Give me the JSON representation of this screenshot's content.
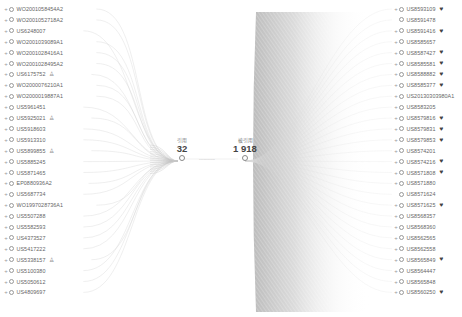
{
  "diagram": {
    "type": "citation-network",
    "left_group": {
      "caption": "引用",
      "count": "32"
    },
    "right_group": {
      "caption": "被引用",
      "count": "1 918"
    },
    "connector_label": "-----------",
    "left_nodes": [
      {
        "id": "WO2001058454A2",
        "badge": ""
      },
      {
        "id": "WO2001052718A2",
        "badge": ""
      },
      {
        "id": "US6248007",
        "badge": ""
      },
      {
        "id": "WO2001039089A1",
        "badge": ""
      },
      {
        "id": "WO2001028416A1",
        "badge": ""
      },
      {
        "id": "WO2001028495A2",
        "badge": ""
      },
      {
        "id": "US6175752",
        "badge": "person"
      },
      {
        "id": "WO2000076210A1",
        "badge": ""
      },
      {
        "id": "WO2000019887A1",
        "badge": ""
      },
      {
        "id": "US5961451",
        "badge": ""
      },
      {
        "id": "US5925021",
        "badge": "person"
      },
      {
        "id": "US5918603",
        "badge": ""
      },
      {
        "id": "US5913310",
        "badge": ""
      },
      {
        "id": "US5899855",
        "badge": "person"
      },
      {
        "id": "US5885245",
        "badge": ""
      },
      {
        "id": "US5871465",
        "badge": ""
      },
      {
        "id": "EP0880936A2",
        "badge": ""
      },
      {
        "id": "US5687734",
        "badge": ""
      },
      {
        "id": "WO1997028736A1",
        "badge": ""
      },
      {
        "id": "US5507288",
        "badge": ""
      },
      {
        "id": "US5582593",
        "badge": ""
      },
      {
        "id": "US4373527",
        "badge": ""
      },
      {
        "id": "US5417222",
        "badge": ""
      },
      {
        "id": "US5338157",
        "badge": "person"
      },
      {
        "id": "US5100380",
        "badge": ""
      },
      {
        "id": "US5050612",
        "badge": ""
      },
      {
        "id": "US4809697",
        "badge": ""
      }
    ],
    "right_nodes": [
      {
        "id": "US8593109",
        "badge": "heart",
        "expand": true
      },
      {
        "id": "US8591478",
        "badge": "",
        "expand": false
      },
      {
        "id": "US8591416",
        "badge": "heart",
        "expand": true
      },
      {
        "id": "US8585657",
        "badge": "",
        "expand": true
      },
      {
        "id": "US8587427",
        "badge": "heart",
        "expand": true
      },
      {
        "id": "US8585581",
        "badge": "heart",
        "expand": true
      },
      {
        "id": "US8588882",
        "badge": "heart",
        "expand": true
      },
      {
        "id": "US8585377",
        "badge": "heart",
        "expand": true
      },
      {
        "id": "US20130303980A1",
        "badge": "",
        "expand": true
      },
      {
        "id": "US8583205",
        "badge": "",
        "expand": true
      },
      {
        "id": "US8579816",
        "badge": "heart",
        "expand": true
      },
      {
        "id": "US8579831",
        "badge": "heart",
        "expand": true
      },
      {
        "id": "US8579853",
        "badge": "heart",
        "expand": true
      },
      {
        "id": "US8574201",
        "badge": "",
        "expand": true
      },
      {
        "id": "US8574216",
        "badge": "heart",
        "expand": true
      },
      {
        "id": "US8571808",
        "badge": "heart",
        "expand": true
      },
      {
        "id": "US8571880",
        "badge": "",
        "expand": true
      },
      {
        "id": "US8571624",
        "badge": "",
        "expand": false
      },
      {
        "id": "US8571625",
        "badge": "heart",
        "expand": true
      },
      {
        "id": "US8568357",
        "badge": "",
        "expand": true
      },
      {
        "id": "US8568360",
        "badge": "",
        "expand": true
      },
      {
        "id": "US8562565",
        "badge": "",
        "expand": true
      },
      {
        "id": "US8562558",
        "badge": "",
        "expand": true
      },
      {
        "id": "US8565849",
        "badge": "heart",
        "expand": true
      },
      {
        "id": "US8564447",
        "badge": "",
        "expand": true
      },
      {
        "id": "US8565848",
        "badge": "",
        "expand": true
      },
      {
        "id": "US8560250",
        "badge": "heart",
        "expand": true
      }
    ],
    "colors": {
      "edge": "#bdbdbd",
      "text": "#666666",
      "count": "#444444",
      "heart": "#444444",
      "node_circle": "#999999"
    },
    "icons": {
      "expand": "+",
      "person": "♙",
      "heart": "♥"
    }
  }
}
